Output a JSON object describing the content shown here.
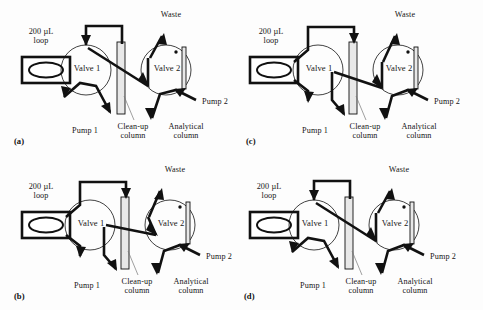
{
  "figure": {
    "type": "schematic-diagram",
    "background_color": "#fdfdfd",
    "line_color": "#111111",
    "column_fill": "#e8e8e8",
    "panel_count": 4
  },
  "labels": {
    "loop": "200 µL\nloop",
    "valve1": "Valve 1",
    "valve2": "Valve 2",
    "waste": "Waste",
    "pump1": "Pump 1",
    "pump2": "Pump 2",
    "cleanup_column": "Clean-up\ncolumn",
    "analytical_column": "Analytical\ncolumn"
  },
  "panels": [
    {
      "id": "a",
      "tag": "(a)",
      "position": "top-left",
      "valve1_state": "load",
      "valve2_state": "waste",
      "description": "Sample loop loaded; Pump 1 flows through Valve 1 to clean-up column; Valve 2 directs effluent to waste; Pump 2 feeds analytical column."
    },
    {
      "id": "c",
      "tag": "(c)",
      "position": "top-right",
      "valve1_state": "inject",
      "valve2_state": "waste",
      "description": "Loop contents injected via top transfer line into clean-up column; Valve 2 still venting to waste."
    },
    {
      "id": "b",
      "tag": "(b)",
      "position": "bottom-left",
      "valve1_state": "inject",
      "valve2_state": "transfer",
      "description": "Clean-up column effluent transferred through Valve 2 onto analytical column; waste line closed."
    },
    {
      "id": "d",
      "tag": "(d)",
      "position": "bottom-right",
      "valve1_state": "load",
      "valve2_state": "transfer",
      "description": "Valve 1 returned to load position while Valve 2 continues routing flow to analytical column."
    }
  ]
}
